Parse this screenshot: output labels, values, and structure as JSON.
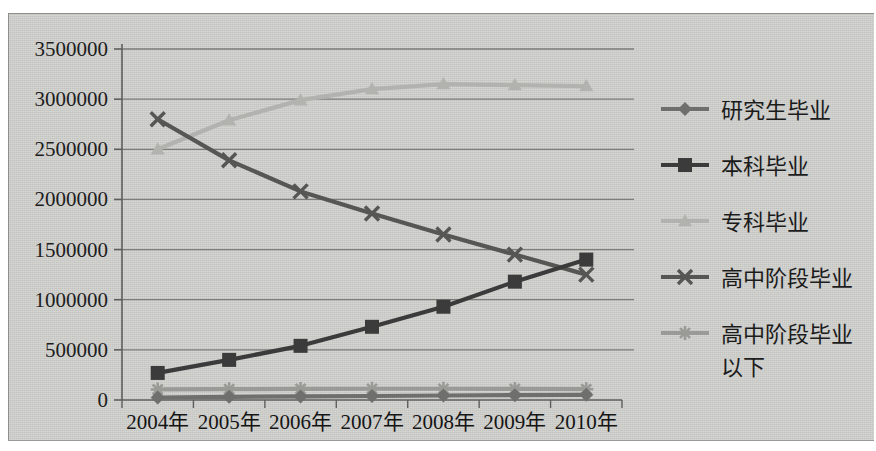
{
  "chart_data": {
    "type": "line",
    "title": "",
    "subtitle": "",
    "xlabel": "",
    "ylabel": "",
    "grid": true,
    "legend_position": "right",
    "ylim": [
      0,
      3500000
    ],
    "ytick_step": 500000,
    "yticks": [
      "0",
      "500000",
      "1000000",
      "1500000",
      "2000000",
      "2500000",
      "3000000",
      "3500000"
    ],
    "ytick_values": [
      0,
      500000,
      1000000,
      1500000,
      2000000,
      2500000,
      3000000,
      3500000
    ],
    "categories": [
      "2004年",
      "2005年",
      "2006年",
      "2007年",
      "2008年",
      "2009年",
      "2010年"
    ],
    "series": [
      {
        "name": "研究生毕业",
        "marker": "diamond",
        "color": "#6f6f6d",
        "values": [
          25000,
          32000,
          36000,
          40000,
          45000,
          48000,
          52000
        ]
      },
      {
        "name": "本科毕业",
        "marker": "square",
        "color": "#3b3b3b",
        "values": [
          270000,
          400000,
          540000,
          730000,
          930000,
          1180000,
          1400000
        ]
      },
      {
        "name": "专科毕业",
        "marker": "triangle",
        "color": "#b2b2ae",
        "values": [
          2500000,
          2790000,
          2990000,
          3100000,
          3150000,
          3140000,
          3130000
        ]
      },
      {
        "name": "高中阶段毕业",
        "marker": "cross",
        "color": "#565654",
        "values": [
          2800000,
          2390000,
          2080000,
          1860000,
          1650000,
          1450000,
          1250000
        ]
      },
      {
        "name": "高中阶段毕业以下",
        "marker": "star",
        "color": "#9a9a96",
        "values": [
          105000,
          108000,
          110000,
          112000,
          112000,
          110000,
          108000
        ]
      }
    ]
  },
  "legend": {
    "items": [
      {
        "label": "研究生毕业",
        "marker": "diamond",
        "color": "#6f6f6d"
      },
      {
        "label": "本科毕业",
        "marker": "square",
        "color": "#3b3b3b"
      },
      {
        "label": "专科毕业",
        "marker": "triangle",
        "color": "#b2b2ae"
      },
      {
        "label": "高中阶段毕业",
        "marker": "cross",
        "color": "#565654"
      },
      {
        "label": "高中阶段毕业",
        "label2": "以下",
        "marker": "star",
        "color": "#9a9a96"
      }
    ]
  },
  "colors": {
    "plot_background": "#c9c9c6",
    "gridline": "#7d7d7a",
    "axis": "#5f5f5d",
    "text": "#1b1b1b"
  }
}
